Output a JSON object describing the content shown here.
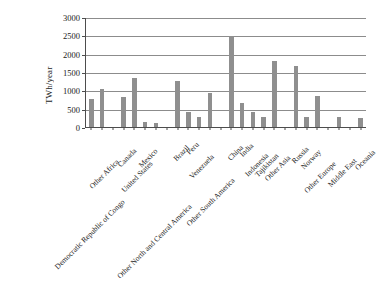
{
  "chart_data": {
    "type": "bar",
    "title": "",
    "subtitle": "",
    "xlabel": "",
    "ylabel": "TWh/year",
    "ylim": [
      0,
      3000
    ],
    "ytick_labels": [
      "0",
      "500",
      "1000",
      "1500",
      "2000",
      "2500",
      "3000"
    ],
    "ytick_values": [
      0,
      500,
      1000,
      1500,
      2000,
      2500,
      3000
    ],
    "grid": "horizontal",
    "legend": "none",
    "bar_color": "#8f8f8f",
    "axis_color": "#4d4d4d",
    "gridline_color": "#8c8c8c",
    "background": "#ffffff",
    "xlabel_rotation": -45,
    "categories": [
      "Democratic Republic of Congo",
      "Other Africa",
      "",
      "Canada",
      "United States",
      "Mexico",
      "Other North and Central America",
      "",
      "Brazil",
      "Peru",
      "Venezuela",
      "Other South America",
      "",
      "China",
      "India",
      "Indonesia",
      "Tajikistan",
      "Other Asia",
      "",
      "Russia",
      "Norway",
      "Other Europe",
      "",
      "Middle East",
      "",
      "Oceania"
    ],
    "values": [
      770,
      1030,
      0,
      830,
      1340,
      150,
      100,
      0,
      1245,
      400,
      280,
      935,
      0,
      2490,
      655,
      405,
      275,
      1790,
      0,
      1675,
      260,
      840,
      0,
      285,
      0,
      240
    ],
    "annotations": []
  }
}
